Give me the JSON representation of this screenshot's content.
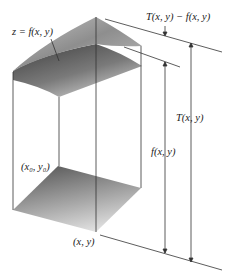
{
  "figure": {
    "labels": {
      "surface": "z = f(x, y)",
      "difference": "T(x, y) − f(x, y)",
      "total_height": "T(x, y)",
      "f_height": "f(x, y)",
      "corner_point": "(x₀, y₀)",
      "point": "(x, y)"
    },
    "colors": {
      "line": "#333333",
      "surface_top_light": "#c8c8c8",
      "surface_top_dark": "#8a8a8a",
      "surface_under_dark": "#4a4a4a",
      "base_dark": "#6a6a6a",
      "base_light": "#e2e2e2"
    }
  }
}
